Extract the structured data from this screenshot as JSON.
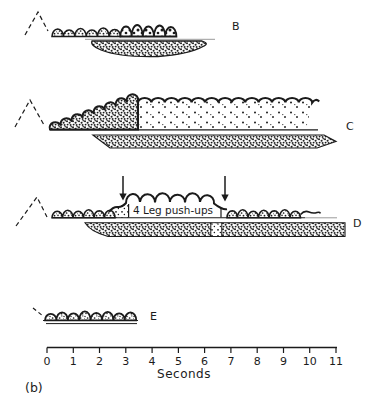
{
  "figure": {
    "panel_label": "(b)",
    "axis": {
      "label": "Seconds",
      "tick_labels": [
        "0",
        "1",
        "2",
        "3",
        "4",
        "5",
        "6",
        "7",
        "8",
        "9",
        "10",
        "11"
      ],
      "range_seconds": [
        0,
        11
      ]
    },
    "traces": [
      {
        "label": "B"
      },
      {
        "label": "C"
      },
      {
        "label": "D",
        "annotation": "4 Leg push-ups",
        "arrow_times_s": [
          2.9,
          6.7
        ]
      },
      {
        "label": "E"
      }
    ],
    "colors": {
      "ink": "#1b1b1b",
      "faint_line": "#9a9a9a",
      "background": "#ffffff"
    }
  }
}
